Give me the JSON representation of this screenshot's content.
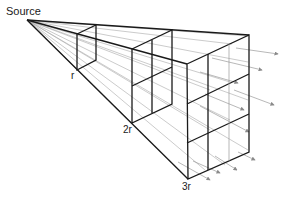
{
  "diagram": {
    "labels": {
      "source": "Source",
      "r1": "r",
      "r2": "2r",
      "r3": "3r"
    },
    "colors": {
      "edge": "#1a1a1a",
      "ray": "#9a9a9a",
      "arrow": "#8a8a8a"
    }
  }
}
